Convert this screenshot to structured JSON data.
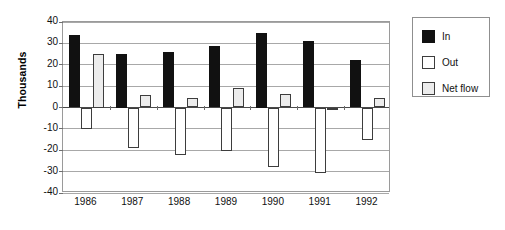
{
  "chart_data": {
    "type": "bar",
    "title": "",
    "subtitle": "",
    "xlabel": "",
    "ylabel": "Thousands",
    "categories": [
      "1986",
      "1987",
      "1988",
      "1989",
      "1990",
      "1991",
      "1992"
    ],
    "series": [
      {
        "name": "In",
        "color": "#111111",
        "values": [
          34,
          25,
          26,
          29,
          35,
          31,
          22
        ]
      },
      {
        "name": "Out",
        "color": "#ffffff",
        "values": [
          -10,
          -19,
          -22,
          -20.5,
          -28,
          -30.5,
          -15
        ]
      },
      {
        "name": "Net flow",
        "color": "#ececec",
        "values": [
          25,
          6,
          4.5,
          9,
          6.5,
          -1,
          4.5
        ]
      }
    ],
    "ylim": [
      -40,
      40
    ],
    "yticks": [
      40,
      30,
      20,
      10,
      0,
      -10,
      -20,
      -30,
      -40
    ],
    "ytick_labels": [
      "40",
      "30",
      "20",
      "10",
      "0",
      "-10",
      "-20",
      "-30",
      "-40"
    ],
    "grid": true,
    "grid_axis": "y",
    "legend": {
      "position": "right",
      "entries": [
        {
          "label": "In",
          "swatch": "black-filled-square"
        },
        {
          "label": "Out",
          "swatch": "white-filled-square"
        },
        {
          "label": "Net flow",
          "swatch": "light-gray-filled-square"
        }
      ]
    },
    "colors": {
      "in": "#111111",
      "out": "#ffffff",
      "net_flow": "#ececec",
      "grid": "#a8a8a8",
      "axis": "#9a9a9a",
      "text": "#111111",
      "background": "#ffffff"
    }
  }
}
